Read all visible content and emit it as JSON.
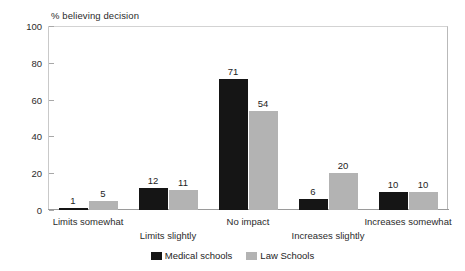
{
  "chart_data": {
    "type": "bar",
    "title": "% believing decision",
    "xlabel": "",
    "ylabel": "% believing decision",
    "categories": [
      "Limits somewhat",
      "Limits slightly",
      "No impact",
      "Increases slightly",
      "Increases somewhat"
    ],
    "series": [
      {
        "name": "Medical schools",
        "color": "#151515",
        "values": [
          1,
          12,
          71,
          6,
          10
        ]
      },
      {
        "name": "Law Schools",
        "color": "#b3b3b3",
        "values": [
          5,
          11,
          54,
          20,
          10
        ]
      }
    ],
    "ylim": [
      0,
      100
    ],
    "yticks": [
      0,
      20,
      40,
      60,
      80,
      100
    ],
    "ytick_labels": [
      "0",
      "20",
      "40",
      "60",
      "80",
      "100"
    ],
    "grid": false,
    "legend_position": "bottom",
    "data_labels": {
      "medical": [
        "1",
        "12",
        "71",
        "6",
        "10"
      ],
      "law": [
        "5",
        "11",
        "54",
        "20",
        "10"
      ]
    }
  },
  "axis": {
    "title": "% believing decision",
    "ytick_labels": [
      "100",
      "80",
      "60",
      "40",
      "20",
      "0"
    ],
    "category_labels": [
      "Limits somewhat",
      "Limits slightly",
      "No impact",
      "Increases slightly",
      "Increases somewhat"
    ]
  },
  "legend": {
    "items": [
      {
        "label": "Medical schools",
        "color": "#151515"
      },
      {
        "label": "Law Schools",
        "color": "#b3b3b3"
      }
    ]
  }
}
